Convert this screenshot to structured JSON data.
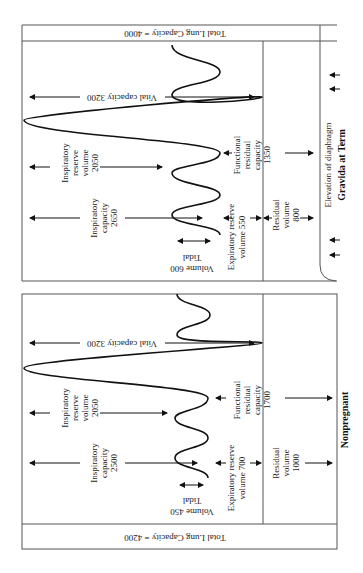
{
  "panels": {
    "pregnant": {
      "title": "Gravida at Term",
      "total_lung_capacity": "Total Lung Capacity = 4000",
      "vital_capacity": "Vital capacity 3200",
      "inspiratory_reserve": [
        "Inspiratory",
        "reserve",
        "volume",
        "2050"
      ],
      "inspiratory_capacity": [
        "Inspiratory",
        "capacity",
        "2650"
      ],
      "tidal_volume": [
        "Tidal",
        "Volume 600"
      ],
      "expiratory_reserve": [
        "Expiratory reserve",
        "volume 550"
      ],
      "functional_residual": [
        "Functional",
        "residual",
        "capacity",
        "1350"
      ],
      "residual_volume": [
        "Residual",
        "volume",
        "800"
      ],
      "diaphragm_note": "Elevation of diaphragm"
    },
    "nonpregnant": {
      "title": "Nonpregnant",
      "total_lung_capacity": "Total Lung Capacity = 4200",
      "vital_capacity": "Vital capacity 3200",
      "inspiratory_reserve": [
        "Inspiratory",
        "reserve",
        "volume",
        "2050"
      ],
      "inspiratory_capacity": [
        "Inspiratory",
        "capacity",
        "2500"
      ],
      "tidal_volume": [
        "Tidal",
        "Volume 450"
      ],
      "expiratory_reserve": [
        "Expiratory reserve",
        "volume 700"
      ],
      "functional_residual": [
        "Functional",
        "residual",
        "capacity",
        "1700"
      ],
      "residual_volume": [
        "Residual",
        "volume",
        "1000"
      ]
    }
  },
  "colors": {
    "line": "#111111",
    "frame": "#555555",
    "background": "#ffffff"
  }
}
